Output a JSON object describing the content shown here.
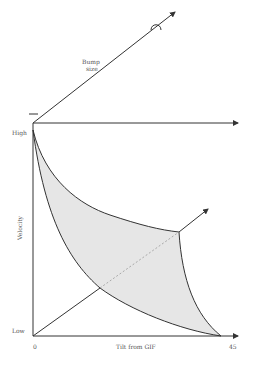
{
  "diagram": {
    "type": "velocity-tilt-bump-size diagram",
    "labels": {
      "bump_size_line1": "Bump",
      "bump_size_line2": "size",
      "y_axis": "Velocity",
      "y_high": "High",
      "y_low": "Low",
      "x_axis": "Tilt from GIF",
      "x_min": "0",
      "x_max": "45",
      "bump_symbol": "∩",
      "origin_marker": "—"
    },
    "colors": {
      "line": "#333333",
      "fill": "#e6e6e6",
      "text": "#555555",
      "background": "#ffffff"
    },
    "axes": {
      "velocity_axis": {
        "from": [
          33,
          336
        ],
        "to": [
          33,
          123
        ]
      },
      "tilt_axis": {
        "from": [
          33,
          336
        ],
        "to": [
          238,
          336
        ]
      },
      "top_horizontal_axis": {
        "from": [
          33,
          123
        ],
        "to": [
          238,
          123
        ]
      },
      "bump_size_axis": {
        "from": [
          33,
          123
        ],
        "to": [
          175,
          12
        ]
      }
    },
    "region": {
      "description": "Shaded region bounded by upper curve, right curve and lower curve",
      "upper_curve_points": [
        [
          33,
          130
        ],
        [
          60,
          180
        ],
        [
          100,
          210
        ],
        [
          140,
          225
        ],
        [
          179,
          232
        ]
      ],
      "lower_curve_points": [
        [
          33,
          130
        ],
        [
          60,
          230
        ],
        [
          100,
          288
        ],
        [
          160,
          325
        ],
        [
          221,
          336
        ]
      ],
      "right_curve_points": [
        [
          179,
          232
        ],
        [
          190,
          300
        ],
        [
          221,
          336
        ]
      ],
      "corner": [
        179,
        232
      ]
    },
    "diagonal": {
      "solid_from": [
        33,
        336
      ],
      "solid_to": [
        100,
        288
      ],
      "dotted_to": [
        179,
        232
      ],
      "arrow_to": [
        208,
        209
      ]
    }
  }
}
